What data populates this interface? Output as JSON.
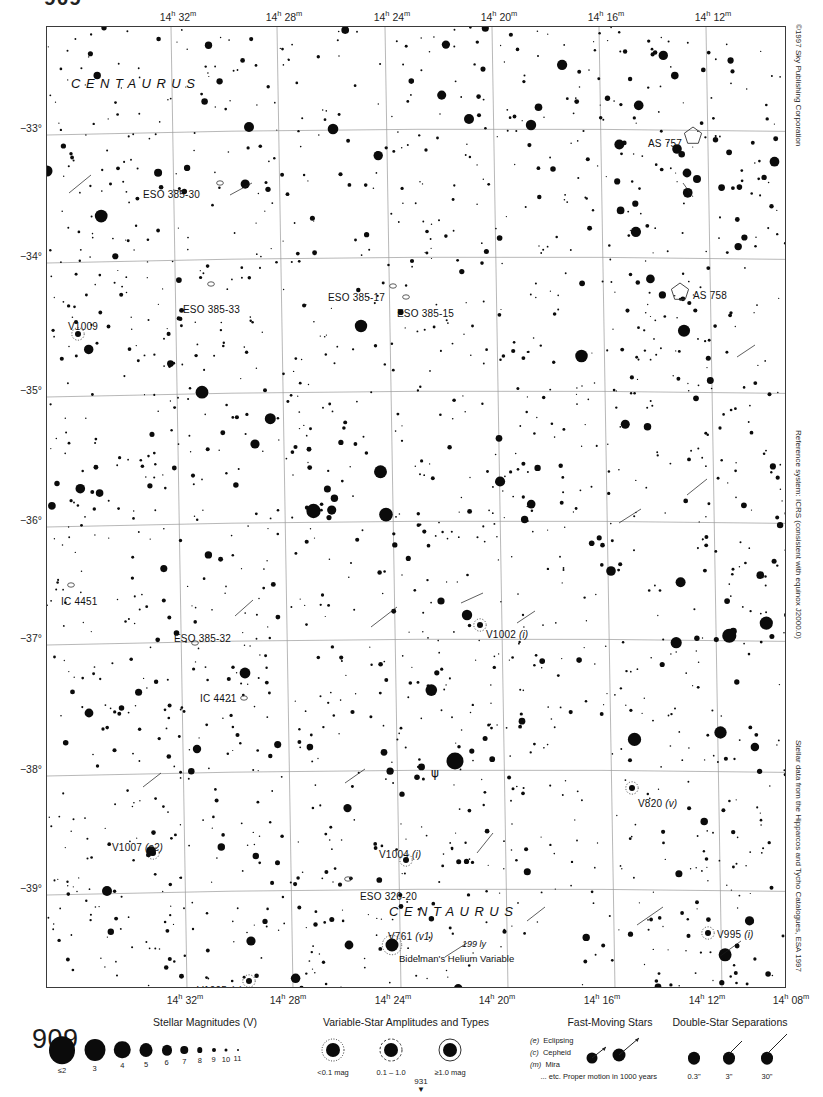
{
  "page": {
    "top_fragment": "909",
    "number": "909",
    "adjacent_chart_index": "931"
  },
  "margin_notes": {
    "copyright": "©1997 Sky Publishing Corporation",
    "reference": "Reference system: ICRS (consistent with equinox J2000.0)",
    "source": "Stellar data from the Hipparcos and Tycho Catalogues, ESA 1997"
  },
  "chart_data": {
    "type": "scatter",
    "xlabel": "Right Ascension (J2000.0)",
    "ylabel": "Declination (J2000.0)",
    "grid": true,
    "legend_position": "bottom",
    "xlim": [
      "14h 34m",
      "14h 07m"
    ],
    "ylim": [
      -39.5,
      -32.6
    ],
    "ra_ticks": [
      {
        "label": "14h 32m",
        "hours": "14",
        "minutes": "32",
        "x_px": 178
      },
      {
        "label": "14h 28m",
        "hours": "14",
        "minutes": "28",
        "x_px": 284
      },
      {
        "label": "14h 24m",
        "hours": "14",
        "minutes": "24",
        "x_px": 392
      },
      {
        "label": "14h 20m",
        "hours": "14",
        "minutes": "20",
        "x_px": 499
      },
      {
        "label": "14h 16m",
        "hours": "14",
        "minutes": "16",
        "x_px": 606
      },
      {
        "label": "14h 12m",
        "hours": "14",
        "minutes": "12",
        "x_px": 713
      },
      {
        "label": "14h 08m",
        "hours": "14",
        "minutes": "08",
        "x_px": 797
      }
    ],
    "ra_ticks_bottom": [
      {
        "label": "14h 32m",
        "hours": "14",
        "minutes": "32",
        "x_px": 185
      },
      {
        "label": "14h 28m",
        "hours": "14",
        "minutes": "28",
        "x_px": 288
      },
      {
        "label": "14h 24m",
        "hours": "14",
        "minutes": "24",
        "x_px": 393
      },
      {
        "label": "14h 20m",
        "hours": "14",
        "minutes": "20",
        "x_px": 497
      },
      {
        "label": "14h 16m",
        "hours": "14",
        "minutes": "16",
        "x_px": 602
      },
      {
        "label": "14h 12m",
        "hours": "14",
        "minutes": "12",
        "x_px": 707
      },
      {
        "label": "14h 08m",
        "hours": "14",
        "minutes": "08",
        "x_px": 791
      }
    ],
    "dec_ticks": [
      {
        "label": "−33°",
        "value": -33,
        "y_px": 128
      },
      {
        "label": "−34°",
        "value": -34,
        "y_px": 256
      },
      {
        "label": "−35°",
        "value": -35,
        "y_px": 390
      },
      {
        "label": "−36°",
        "value": -36,
        "y_px": 520
      },
      {
        "label": "−37°",
        "value": -37,
        "y_px": 638
      },
      {
        "label": "−38°",
        "value": -38,
        "y_px": 769
      },
      {
        "label": "−39°",
        "value": -39,
        "y_px": 888
      }
    ],
    "constellation_labels": [
      {
        "name": "CENTAURUS",
        "x_px": 70,
        "y_px": 75
      },
      {
        "name": "CENTAURUS",
        "x_px": 388,
        "y_px": 903
      }
    ],
    "deep_sky_objects": [
      {
        "name": "ESO 385-30",
        "type": "galaxy",
        "label_x": 142,
        "label_y": 188,
        "sym_x": 219,
        "sym_y": 182
      },
      {
        "name": "ESO 385-33",
        "type": "galaxy",
        "label_x": 182,
        "label_y": 303,
        "sym_x": 210,
        "sym_y": 283
      },
      {
        "name": "ESO 385-17",
        "type": "galaxy",
        "label_x": 327,
        "label_y": 291,
        "sym_x": 392,
        "sym_y": 285
      },
      {
        "name": "ESO 385-15",
        "type": "galaxy",
        "label_x": 396,
        "label_y": 307,
        "sym_x": 405,
        "sym_y": 296
      },
      {
        "name": "ESO 385-32",
        "type": "galaxy",
        "label_x": 173,
        "label_y": 632,
        "sym_x": 194,
        "sym_y": 642
      },
      {
        "name": "ESO 326-20",
        "type": "galaxy",
        "label_x": 359,
        "label_y": 890,
        "sym_x": 347,
        "sym_y": 878
      },
      {
        "name": "IC 4451",
        "type": "galaxy",
        "label_x": 60,
        "label_y": 595,
        "sym_x": 70,
        "sym_y": 584
      },
      {
        "name": "IC 4421",
        "type": "galaxy",
        "label_x": 199,
        "label_y": 692,
        "sym_x": 243,
        "sym_y": 697
      },
      {
        "name": "AS 757",
        "type": "open-cluster",
        "label_x": 647,
        "label_y": 137,
        "sym_x": 692,
        "sym_y": 135
      },
      {
        "name": "AS 758",
        "type": "open-cluster",
        "label_x": 692,
        "label_y": 289,
        "sym_x": 679,
        "sym_y": 291
      }
    ],
    "variable_stars": [
      {
        "name": "V1009",
        "type": "",
        "label_x": 67,
        "label_y": 320,
        "sym_x": 77,
        "sym_y": 333
      },
      {
        "name": "V1002",
        "type": "(i)",
        "label_x": 485,
        "label_y": 628,
        "sym_x": 479,
        "sym_y": 624
      },
      {
        "name": "V820",
        "type": "(v)",
        "label_x": 637,
        "label_y": 797,
        "sym_x": 631,
        "sym_y": 787
      },
      {
        "name": "V995",
        "type": "(i)",
        "label_x": 716,
        "label_y": 928,
        "sym_x": 707,
        "sym_y": 932
      },
      {
        "name": "V1007",
        "type": "(s2)",
        "label_x": 111,
        "label_y": 841,
        "sym_x": 152,
        "sym_y": 852
      },
      {
        "name": "V1004",
        "type": "(i)",
        "label_x": 378,
        "label_y": 848,
        "sym_x": 405,
        "sym_y": 859
      },
      {
        "name": "V1005",
        "type": "(s)",
        "label_x": 196,
        "label_y": 984,
        "sym_x": 248,
        "sym_y": 980
      },
      {
        "name": "V761",
        "type": "(v1)",
        "label_x": 387,
        "label_y": 930,
        "sym_x": 391,
        "sym_y": 944
      }
    ],
    "bayer_stars": [
      {
        "glyph": "ψ",
        "name": "psi Centauri",
        "label_x": 430,
        "label_y": 765,
        "sym_x": 454,
        "sym_y": 760
      }
    ],
    "annotations": [
      {
        "text": "199 ly",
        "x_px": 461,
        "y_px": 938,
        "style": "distance"
      },
      {
        "text": "Bidelman's Helium Variable",
        "x_px": 398,
        "y_px": 952,
        "style": "note"
      }
    ]
  },
  "legend": {
    "magnitudes": {
      "title": "Stellar Magnitudes (V)",
      "entries": [
        {
          "label": "≤2",
          "size": 26
        },
        {
          "label": "3",
          "size": 21
        },
        {
          "label": "4",
          "size": 16.5
        },
        {
          "label": "5",
          "size": 13
        },
        {
          "label": "6",
          "size": 10
        },
        {
          "label": "7",
          "size": 7.5
        },
        {
          "label": "8",
          "size": 5.5
        },
        {
          "label": "9",
          "size": 4
        },
        {
          "label": "10",
          "size": 3
        },
        {
          "label": "11",
          "size": 2
        }
      ]
    },
    "variables": {
      "title": "Variable-Star Amplitudes and Types",
      "amplitudes": [
        {
          "label": "<0.1 mag",
          "style": "dotted"
        },
        {
          "label": "0.1 – 1.0",
          "style": "dashed"
        },
        {
          "label": "≥1.0 mag",
          "style": "solid"
        }
      ],
      "types": [
        {
          "code": "(e)",
          "name": "Eclipsing"
        },
        {
          "code": "(c)",
          "name": "Cepheid"
        },
        {
          "code": "(m)",
          "name": "Mira"
        },
        {
          "code": "",
          "name": "... etc."
        }
      ]
    },
    "fast_moving": {
      "title": "Fast-Moving Stars",
      "caption": "Proper motion in 1000 years"
    },
    "double_stars": {
      "title": "Double-Star Separations",
      "entries": [
        "0.3\"",
        "3\"",
        "30\""
      ]
    }
  }
}
